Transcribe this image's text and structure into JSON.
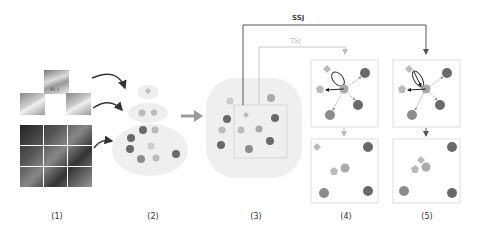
{
  "figure": {
    "panel_labels": [
      "(1)",
      "(2)",
      "(3)",
      "(4)",
      "(5)"
    ],
    "connectors": {
      "ssj_label": "SSJ",
      "tsj_label": "TSJ",
      "transform_label": "A(·)"
    },
    "colors": {
      "dark_circle": "#6a6a6a",
      "mid_circle": "#8c8c8c",
      "light_shape": "#b8b8b8",
      "cluster_bg": "#eeeeee",
      "arrow": "#333333",
      "big_arrow": "#9a9a9a",
      "tsj_line": "#c8c8c8",
      "ssj_line": "#555555",
      "box_border": "#d8d8d8"
    }
  }
}
